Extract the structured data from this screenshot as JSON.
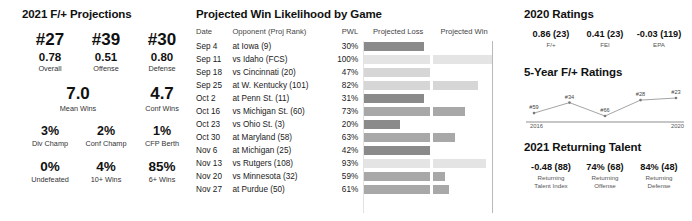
{
  "left": {
    "title": "2021 F/+ Projections",
    "ranks": [
      {
        "rank": "#27",
        "value": "0.78",
        "label": "Overall"
      },
      {
        "rank": "#39",
        "value": "0.51",
        "label": "Offense"
      },
      {
        "rank": "#30",
        "value": "0.80",
        "label": "Defense"
      }
    ],
    "wins": [
      {
        "value": "7.0",
        "label": "Mean Wins"
      },
      {
        "value": "4.7",
        "label": "Conf Wins"
      }
    ],
    "odds": [
      {
        "value": "3%",
        "label": "Div Champ"
      },
      {
        "value": "2%",
        "label": "Conf Champ"
      },
      {
        "value": "1%",
        "label": "CFP Berth"
      }
    ],
    "totals": [
      {
        "value": "0%",
        "label": "Undefeated"
      },
      {
        "value": "4%",
        "label": "10+ Wins"
      },
      {
        "value": "85%",
        "label": "6+ Wins"
      }
    ]
  },
  "middle": {
    "title": "Projected Win Likelihood by Game",
    "columns": {
      "date": "Date",
      "opponent": "Opponent (Proj Rank)",
      "pwl": "PWL",
      "loss": "Projected Loss",
      "win": "Projected Win"
    }
  },
  "right": {
    "ratings_title": "2020 Ratings",
    "ratings": [
      {
        "value": "0.86 (23)",
        "label": "F/+"
      },
      {
        "value": "0.41 (23)",
        "label": "FEI"
      },
      {
        "value": "-0.03 (119)",
        "label": "EPA"
      }
    ],
    "spark_title": "5-Year F/+ Ratings",
    "spark_year_start": "2016",
    "spark_year_end": "2020",
    "talent_title": "2021 Returning Talent",
    "talent": [
      {
        "value": "-0.48 (88)",
        "label1": "Returning",
        "label2": "Talent Index"
      },
      {
        "value": "74% (68)",
        "label1": "Returning",
        "label2": "Offense"
      },
      {
        "value": "84% (48)",
        "label1": "Returning",
        "label2": "Defense"
      }
    ]
  },
  "chart_data": [
    {
      "type": "bar",
      "title": "Projected Win Likelihood by Game",
      "xlabel": "",
      "ylabel": "",
      "orientation": "horizontal-diverging",
      "columns": [
        "Date",
        "Opponent (Proj Rank)",
        "PWL",
        "Projected Loss",
        "Projected Win"
      ],
      "rows": [
        {
          "date": "Sep 4",
          "opponent": "at Iowa (9)",
          "pwl": "30%",
          "pwl_value": 30,
          "loss_width": 60,
          "win_width": 0
        },
        {
          "date": "Sep 11",
          "opponent": "vs Idaho (FCS)",
          "pwl": "100%",
          "pwl_value": 100,
          "loss_width": 66,
          "win_width": 59
        },
        {
          "date": "Sep 18",
          "opponent": "vs Cincinnati (20)",
          "pwl": "47%",
          "pwl_value": 47,
          "loss_width": 66,
          "win_width": 0
        },
        {
          "date": "Sep 25",
          "opponent": "at W. Kentucky (101)",
          "pwl": "82%",
          "pwl_value": 82,
          "loss_width": 66,
          "win_width": 45
        },
        {
          "date": "Oct 2",
          "opponent": "at Penn St. (11)",
          "pwl": "31%",
          "pwl_value": 31,
          "loss_width": 60,
          "win_width": 0
        },
        {
          "date": "Oct 16",
          "opponent": "vs Michigan St. (60)",
          "pwl": "73%",
          "pwl_value": 73,
          "loss_width": 66,
          "win_width": 32
        },
        {
          "date": "Oct 23",
          "opponent": "vs Ohio St. (3)",
          "pwl": "20%",
          "pwl_value": 20,
          "loss_width": 36,
          "win_width": 0
        },
        {
          "date": "Oct 30",
          "opponent": "at Maryland (58)",
          "pwl": "63%",
          "pwl_value": 63,
          "loss_width": 66,
          "win_width": 22
        },
        {
          "date": "Nov 6",
          "opponent": "at Michigan (25)",
          "pwl": "42%",
          "pwl_value": 42,
          "loss_width": 66,
          "win_width": 0
        },
        {
          "date": "Nov 13",
          "opponent": "vs Rutgers (108)",
          "pwl": "93%",
          "pwl_value": 93,
          "loss_width": 66,
          "win_width": 53
        },
        {
          "date": "Nov 20",
          "opponent": "vs Minnesota (32)",
          "pwl": "59%",
          "pwl_value": 59,
          "loss_width": 66,
          "win_width": 12
        },
        {
          "date": "Nov 27",
          "opponent": "at Purdue (50)",
          "pwl": "61%",
          "pwl_value": 61,
          "loss_width": 66,
          "win_width": 16
        }
      ]
    },
    {
      "type": "line",
      "title": "5-Year F/+ Ratings",
      "x": [
        "2016",
        "2017",
        "2018",
        "2019",
        "2020"
      ],
      "tick_labels": [
        "2016",
        "2020"
      ],
      "point_labels": [
        "#59",
        "#34",
        "#66",
        "#28",
        "#23"
      ],
      "values": [
        59,
        34,
        66,
        28,
        23
      ],
      "ylabel": "F/+ Rank",
      "grid": false
    }
  ],
  "colors": {
    "bar_dark": "#8a8a8a",
    "bar_mid": "#b0b0b0",
    "bar_light": "#d6d6d6",
    "bar_lightest": "#e4e4e4",
    "axis": "#b9b9b9",
    "text": "#1a1a1a"
  }
}
